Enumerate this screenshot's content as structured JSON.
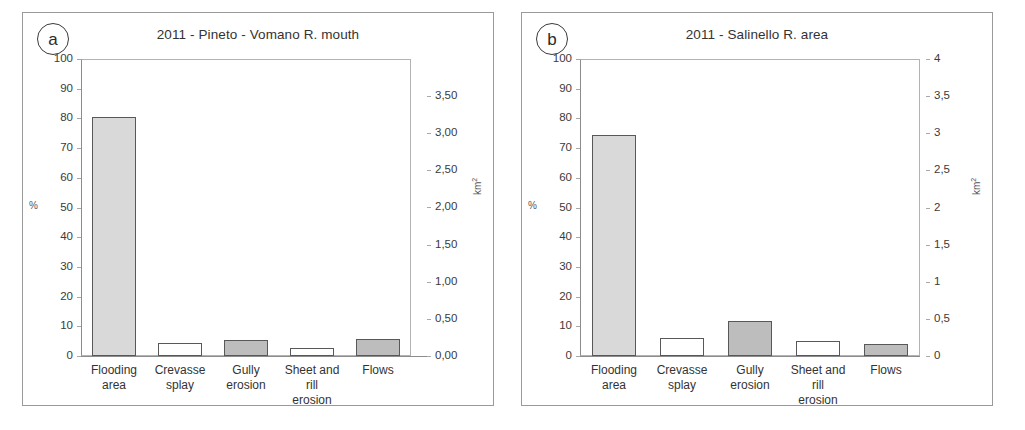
{
  "figure": {
    "panels": [
      {
        "tag": "a",
        "title": "2011 - Pineto - Vomano R. mouth",
        "left_axis_unit": "%",
        "right_axis_unit": "km",
        "right_axis_unit_sup": "2",
        "left_ticks": [
          "100",
          "90",
          "80",
          "70",
          "60",
          "50",
          "40",
          "30",
          "20",
          "10",
          "0"
        ],
        "right_ticks": [
          "3,50",
          "3,00",
          "2,50",
          "2,00",
          "1,50",
          "1,00",
          "0,50",
          "0,00"
        ]
      },
      {
        "tag": "b",
        "title": "2011 - Salinello R. area",
        "left_axis_unit": "%",
        "right_axis_unit": "km",
        "right_axis_unit_sup": "2",
        "left_ticks": [
          "100",
          "90",
          "80",
          "70",
          "60",
          "50",
          "40",
          "30",
          "20",
          "10",
          "0"
        ],
        "right_ticks": [
          "4",
          "3,5",
          "3",
          "2,5",
          "2",
          "1,5",
          "1",
          "0,5",
          "0"
        ]
      }
    ]
  },
  "chart_data": [
    {
      "type": "bar",
      "title": "2011 - Pineto - Vomano R. mouth",
      "panel_tag": "a",
      "categories": [
        "Flooding area",
        "Crevasse splay",
        "Gully erosion",
        "Sheet and rill erosion",
        "Flows"
      ],
      "category_lines": [
        [
          "Flooding",
          "area"
        ],
        [
          "Crevasse",
          "splay"
        ],
        [
          "Gully",
          "erosion"
        ],
        [
          "Sheet and rill",
          "erosion"
        ],
        [
          "Flows"
        ]
      ],
      "values": [
        80.5,
        4.3,
        5.3,
        2.8,
        5.6
      ],
      "bar_fills": [
        "light",
        "white",
        "mid",
        "white",
        "mid"
      ],
      "xlabel": "",
      "ylabel": "%",
      "ylim": [
        0,
        100
      ],
      "y_ticks": [
        0,
        10,
        20,
        30,
        40,
        50,
        60,
        70,
        80,
        90,
        100
      ],
      "secondary_ylabel": "km2",
      "secondary_ylim": [
        0,
        4.0
      ],
      "secondary_y_ticks": [
        "0,00",
        "0,50",
        "1,00",
        "1,50",
        "2,00",
        "2,50",
        "3,00",
        "3,50"
      ],
      "grid": false,
      "legend": "none"
    },
    {
      "type": "bar",
      "title": "2011 - Salinello R. area",
      "panel_tag": "b",
      "categories": [
        "Flooding area",
        "Crevasse splay",
        "Gully erosion",
        "Sheet and rill erosion",
        "Flows"
      ],
      "category_lines": [
        [
          "Flooding",
          "area"
        ],
        [
          "Crevasse",
          "splay"
        ],
        [
          "Gully",
          "erosion"
        ],
        [
          "Sheet and rill",
          "erosion"
        ],
        [
          "Flows"
        ]
      ],
      "values": [
        74.3,
        6.0,
        11.9,
        5.0,
        4.0
      ],
      "bar_fills": [
        "light",
        "white",
        "mid",
        "white",
        "mid"
      ],
      "xlabel": "",
      "ylabel": "%",
      "ylim": [
        0,
        100
      ],
      "y_ticks": [
        0,
        10,
        20,
        30,
        40,
        50,
        60,
        70,
        80,
        90,
        100
      ],
      "secondary_ylabel": "km2",
      "secondary_ylim": [
        0,
        4.4
      ],
      "secondary_y_ticks": [
        "0",
        "0,5",
        "1",
        "1,5",
        "2",
        "2,5",
        "3",
        "3,5",
        "4"
      ],
      "grid": false,
      "legend": "none"
    }
  ],
  "colors": {
    "bar_light": "#d9d9d9",
    "bar_mid": "#bdbdbd",
    "bar_white": "#ffffff",
    "bar_outline": "#585858",
    "axis": "#8c8c8c",
    "text": "#333333",
    "panel_border": "#9a9a9a"
  }
}
